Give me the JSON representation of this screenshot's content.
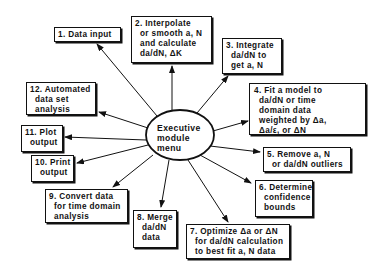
{
  "diagram": {
    "center": {
      "lines": [
        "Executive",
        "module",
        "menu"
      ]
    },
    "modules": [
      {
        "id": 1,
        "lines": [
          "1. Data input"
        ]
      },
      {
        "id": 2,
        "lines": [
          "2. Interpolate",
          "or smooth a, N",
          "and calculate",
          "da/dN, ΔK"
        ]
      },
      {
        "id": 3,
        "lines": [
          "3. Integrate",
          "da/dN to",
          "get a, N"
        ]
      },
      {
        "id": 4,
        "lines": [
          "4. Fit a model to",
          "da/dN or time",
          "domain data",
          "weighted by Δa,",
          "Δa/ε, or ΔN"
        ]
      },
      {
        "id": 5,
        "lines": [
          "5. Remove a, N",
          "or da/dN outliers"
        ]
      },
      {
        "id": 6,
        "lines": [
          "6. Determine",
          "confidence",
          "bounds"
        ]
      },
      {
        "id": 7,
        "lines": [
          "7. Optimize Δa or ΔN",
          "for da/dN calculation",
          "to best fit a, N data"
        ]
      },
      {
        "id": 8,
        "lines": [
          "8. Merge",
          "da/dN",
          "data"
        ]
      },
      {
        "id": 9,
        "lines": [
          "9. Convert data",
          "for time domain",
          "analysis"
        ]
      },
      {
        "id": 10,
        "lines": [
          "10. Print",
          "output"
        ]
      },
      {
        "id": 11,
        "lines": [
          "11. Plot",
          "output"
        ]
      },
      {
        "id": 12,
        "lines": [
          "12. Automated",
          "data set",
          "analysis"
        ]
      }
    ],
    "colors": {
      "ink": "#111111",
      "background": "#ffffff"
    }
  }
}
